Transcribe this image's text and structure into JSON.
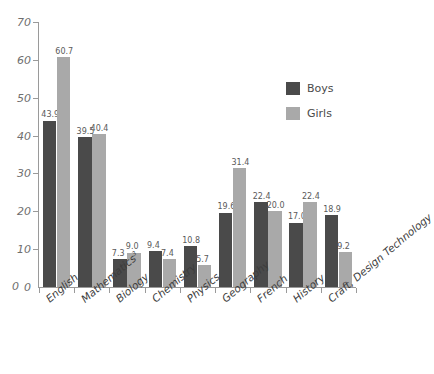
{
  "chart_data": {
    "type": "bar",
    "title": "",
    "xlabel": "",
    "ylabel": "",
    "ylim": [
      0,
      70
    ],
    "ytick_labels": [
      "70",
      "60",
      "50",
      "40",
      "30",
      "20",
      "10",
      "0"
    ],
    "ytick_values": [
      70,
      60,
      50,
      40,
      30,
      20,
      10,
      0
    ],
    "grid": false,
    "legend_position": "top-right",
    "categories": [
      "English",
      "Mathematics",
      "Biology",
      "Chemistry",
      "Physics",
      "Geography",
      "French",
      "History",
      "Craft, Design Technology"
    ],
    "category_superscripts": [
      "",
      "3",
      "",
      "",
      "",
      "",
      "",
      "",
      ""
    ],
    "series": [
      {
        "name": "Boys",
        "color": "#4a4a4a",
        "values": [
          43.9,
          39.5,
          7.3,
          9.4,
          10.8,
          19.6,
          22.4,
          17.0,
          18.9
        ],
        "value_labels": [
          "43.9",
          "39.5",
          "7.3",
          "9.4",
          "10.8",
          "19.6",
          "22.4",
          "17.0",
          "18.9"
        ]
      },
      {
        "name": "Girls",
        "color": "#a9a9a9",
        "values": [
          60.7,
          40.4,
          9.0,
          7.4,
          5.7,
          31.4,
          20.0,
          22.4,
          9.2
        ],
        "value_labels": [
          "60.7",
          "40.4",
          "9.0",
          "7.4",
          "5.7",
          "31.4",
          "20.0",
          "22.4",
          "9.2"
        ]
      }
    ]
  },
  "legend": {
    "items": [
      {
        "label": "Boys",
        "color": "#4a4a4a"
      },
      {
        "label": "Girls",
        "color": "#a9a9a9"
      }
    ]
  },
  "axis": {
    "zero_label": "0"
  }
}
